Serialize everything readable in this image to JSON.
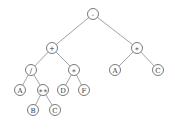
{
  "diagram": {
    "type": "expression-tree",
    "nodes": [
      {
        "id": "n0",
        "label": "-",
        "x": 93,
        "y": 14
      },
      {
        "id": "n1",
        "label": "+",
        "x": 52,
        "y": 48
      },
      {
        "id": "n2",
        "label": "∗",
        "x": 137,
        "y": 48
      },
      {
        "id": "n3",
        "label": "/",
        "x": 31,
        "y": 70
      },
      {
        "id": "n4",
        "label": "∗",
        "x": 74,
        "y": 70
      },
      {
        "id": "n5",
        "label": "A",
        "x": 115,
        "y": 70
      },
      {
        "id": "n6",
        "label": "C",
        "x": 158,
        "y": 70
      },
      {
        "id": "n7",
        "label": "A",
        "x": 20,
        "y": 90
      },
      {
        "id": "n8",
        "label": "∗∗",
        "x": 43,
        "y": 90
      },
      {
        "id": "n9",
        "label": "D",
        "x": 63,
        "y": 90
      },
      {
        "id": "n10",
        "label": "F",
        "x": 84,
        "y": 90
      },
      {
        "id": "n11",
        "label": "B",
        "x": 33,
        "y": 110
      },
      {
        "id": "n12",
        "label": "C",
        "x": 55,
        "y": 110
      }
    ],
    "edges": [
      [
        "n0",
        "n1"
      ],
      [
        "n0",
        "n2"
      ],
      [
        "n1",
        "n3"
      ],
      [
        "n1",
        "n4"
      ],
      [
        "n2",
        "n5"
      ],
      [
        "n2",
        "n6"
      ],
      [
        "n3",
        "n7"
      ],
      [
        "n3",
        "n8"
      ],
      [
        "n4",
        "n9"
      ],
      [
        "n4",
        "n10"
      ],
      [
        "n8",
        "n11"
      ],
      [
        "n8",
        "n12"
      ]
    ],
    "node_radius": 5.5
  }
}
